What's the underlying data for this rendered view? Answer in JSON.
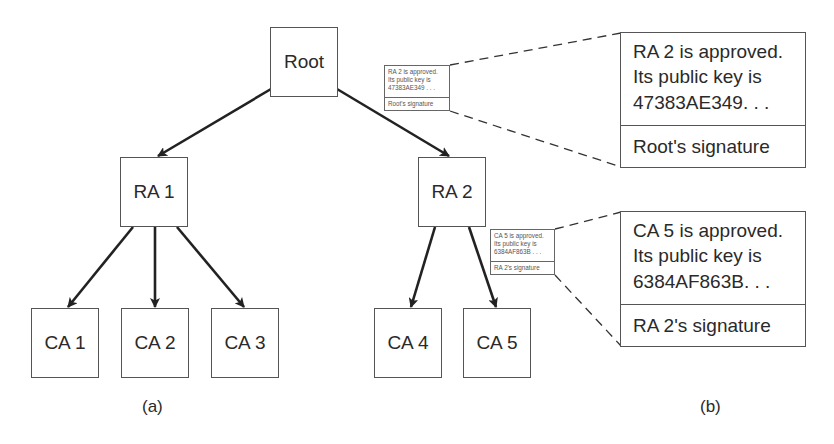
{
  "tree": {
    "root": {
      "label": "Root"
    },
    "ra": [
      {
        "label": "RA 1"
      },
      {
        "label": "RA 2"
      }
    ],
    "ca": [
      {
        "label": "CA 1"
      },
      {
        "label": "CA 2"
      },
      {
        "label": "CA 3"
      },
      {
        "label": "CA 4"
      },
      {
        "label": "CA 5"
      }
    ],
    "caption": "(a)"
  },
  "certificates": [
    {
      "lines": [
        "RA 2 is approved.",
        "Its public key is",
        "47383AE349. . ."
      ],
      "small_lines": [
        "RA 2 is approved.",
        "Its public key is",
        "47383AE349 . . ."
      ],
      "signature": "Root's signature"
    },
    {
      "lines": [
        "CA 5 is approved.",
        "Its public key is",
        "6384AF863B. . ."
      ],
      "small_lines": [
        "CA 5 is approved.",
        "Its public key is",
        "6384AF863B . . ."
      ],
      "signature": "RA 2's signature"
    }
  ],
  "detail_caption": "(b)",
  "colors": {
    "stroke": "#2a2a2a",
    "box_border": "#555555",
    "text": "#2a2a2a"
  }
}
